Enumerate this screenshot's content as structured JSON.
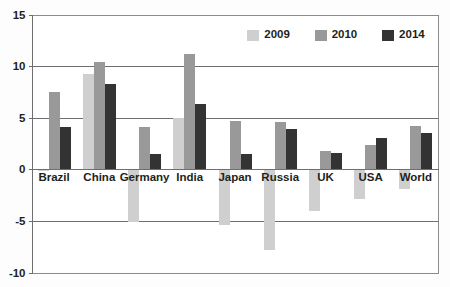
{
  "chart_data": {
    "type": "bar",
    "title": "",
    "subtitle": "",
    "xlabel": "",
    "ylabel": "",
    "ylim": [
      -10,
      15
    ],
    "yticks": [
      -10,
      -5,
      0,
      5,
      10,
      15
    ],
    "ytick_labels": [
      "-10",
      "-5",
      "0",
      "5",
      "10",
      "15"
    ],
    "grid": true,
    "grid_axis": "y",
    "legend_position": "top-right",
    "categories": [
      "Brazil",
      "China",
      "Germany",
      "India",
      "Japan",
      "Russia",
      "UK",
      "USA",
      "World"
    ],
    "series": [
      {
        "name": "2009",
        "color": "#cfcfcf",
        "values": [
          -0.2,
          9.2,
          -5.1,
          5.0,
          -5.4,
          -7.8,
          -4.0,
          -2.9,
          -1.9
        ]
      },
      {
        "name": "2010",
        "color": "#999999",
        "values": [
          7.5,
          10.4,
          4.1,
          11.2,
          4.7,
          4.6,
          1.8,
          2.4,
          4.2
        ]
      },
      {
        "name": "2014",
        "color": "#333333",
        "values": [
          4.1,
          8.3,
          1.5,
          6.3,
          1.5,
          3.9,
          1.6,
          3.0,
          3.5
        ]
      }
    ]
  },
  "legend": {
    "entries": [
      {
        "label": "2009",
        "color": "#cfcfcf"
      },
      {
        "label": "2010",
        "color": "#999999"
      },
      {
        "label": "2014",
        "color": "#333333"
      }
    ]
  },
  "colors": {
    "series_2009": "#cfcfcf",
    "series_2010": "#999999",
    "series_2014": "#333333",
    "axis": "#6d6e71",
    "frame": "#8a8b8d",
    "text": "#231f20",
    "background": "#fdfdfd"
  }
}
